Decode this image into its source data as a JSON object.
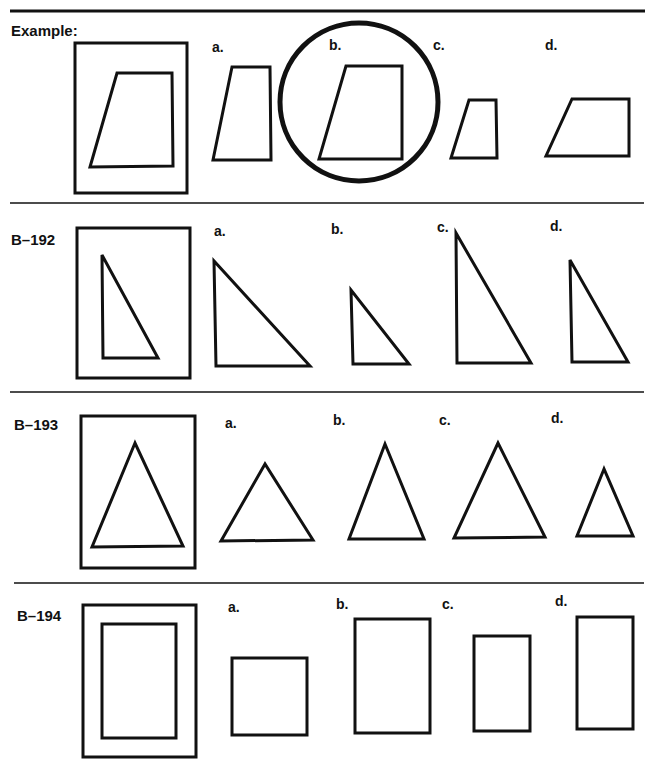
{
  "worksheet": {
    "colors": {
      "ink": "#111111",
      "background": "#ffffff"
    },
    "option_labels": [
      "a.",
      "b.",
      "c.",
      "d."
    ],
    "rows": [
      {
        "label": "Example:",
        "shape_type": "trapezoid",
        "target": {
          "frame": [
            75,
            43,
            112,
            150
          ],
          "shape": "117,73 172,73 173,166 90,167"
        },
        "options": [
          {
            "label": "a.",
            "label_pos": [
              212,
              48
            ],
            "shape": "232,67 270,67 271,160 213,160"
          },
          {
            "label": "b.",
            "label_pos": [
              328,
              48
            ],
            "shape": "346,66 402,66 402,159 319,159",
            "circled": true
          },
          {
            "label": "c.",
            "label_pos": [
              432,
              48
            ],
            "shape": "469,100 496,100 497,158 451,158"
          },
          {
            "label": "d.",
            "label_pos": [
              544,
              48
            ],
            "shape": "572,99 629,99 629,156 546,156"
          }
        ],
        "answer": "b."
      },
      {
        "label": "B–192",
        "shape_type": "right-triangle",
        "target": {
          "frame": [
            77,
            228,
            113,
            150
          ],
          "shape": "102,255 103,358 158,358"
        },
        "options": [
          {
            "label": "a.",
            "label_pos": [
              214,
              237
            ],
            "shape": "214,261 216,366 310,366"
          },
          {
            "label": "b.",
            "label_pos": [
              330,
              235
            ],
            "shape": "351,290 353,364 409,364"
          },
          {
            "label": "c.",
            "label_pos": [
              437,
              233
            ],
            "shape": "456,233 457,363 531,363"
          },
          {
            "label": "d.",
            "label_pos": [
              550,
              232
            ],
            "shape": "570,260 572,362 628,362"
          }
        ]
      },
      {
        "label": "B–193",
        "shape_type": "isosceles-triangle",
        "target": {
          "frame": [
            81,
            416,
            114,
            152
          ],
          "shape": "135,443 92,547 183,546"
        },
        "options": [
          {
            "label": "a.",
            "label_pos": [
              225,
              428
            ],
            "shape": "265,464 221,541 313,540"
          },
          {
            "label": "b.",
            "label_pos": [
              333,
              425
            ],
            "shape": "385,444 349,539 424,539"
          },
          {
            "label": "c.",
            "label_pos": [
              439,
              425
            ],
            "shape": "498,443 454,538 545,537"
          },
          {
            "label": "d.",
            "label_pos": [
              552,
              423
            ],
            "shape": "604,469 577,536 633,536"
          }
        ]
      },
      {
        "label": "B–194",
        "shape_type": "rectangle",
        "target": {
          "frame": [
            83,
            605,
            113,
            152
          ],
          "shape": "102,624 176,624 176,738 102,738"
        },
        "options": [
          {
            "label": "a.",
            "label_pos": [
              228,
              612
            ],
            "shape": "232,658 307,658 307,735 232,735"
          },
          {
            "label": "b.",
            "label_pos": [
              336,
              608
            ],
            "shape": "355,619 430,619 430,733 355,733"
          },
          {
            "label": "c.",
            "label_pos": [
              442,
              608
            ],
            "shape": "474,636 530,636 530,731 474,731"
          },
          {
            "label": "d.",
            "label_pos": [
              555,
              605
            ],
            "shape": "577,617 633,617 633,729 577,729"
          }
        ]
      }
    ]
  }
}
